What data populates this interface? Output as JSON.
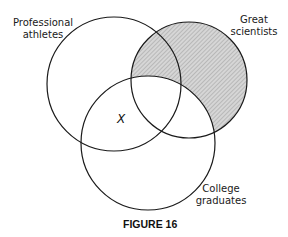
{
  "figure": {
    "caption": "FIGURE 16",
    "marker": "X",
    "sets": [
      {
        "id": "athletes",
        "line1": "Professional",
        "line2": "athletes",
        "cx": 114,
        "cy": 84,
        "r": 67
      },
      {
        "id": "scientists",
        "line1": "Great",
        "line2": "scientists",
        "cx": 189,
        "cy": 80,
        "r": 58
      },
      {
        "id": "graduates",
        "line1": "College",
        "line2": "graduates",
        "cx": 148,
        "cy": 143,
        "r": 67
      }
    ],
    "shaded_region": "Great scientists not College graduates",
    "colors": {
      "stroke": "#1a1a1a",
      "shade": "#bdbdbd",
      "background": "#ffffff"
    }
  }
}
